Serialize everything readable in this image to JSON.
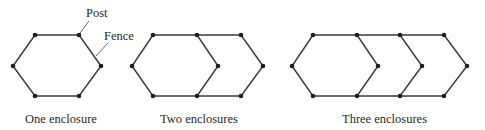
{
  "annotations": {
    "post_label": "Post",
    "fence_label": "Fence"
  },
  "diagrams": [
    {
      "caption": "One enclosure",
      "enclosures": 1
    },
    {
      "caption": "Two enclosures",
      "enclosures": 2
    },
    {
      "caption": "Three enclosures",
      "enclosures": 3
    }
  ],
  "colors": {
    "fence": "#3a3a3a",
    "post": "#1e1e1e",
    "text": "#2a2a2a"
  }
}
